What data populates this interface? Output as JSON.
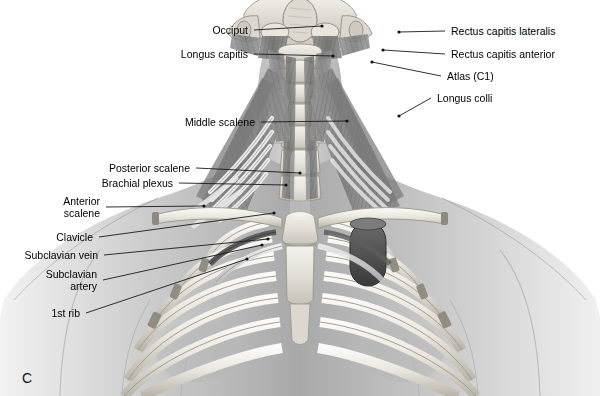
{
  "figure": {
    "panel_letter": "C",
    "view": "anterior",
    "style": "grayscale medical illustration",
    "background_color": "#ffffff",
    "label_color": "#000000",
    "leader_color": "#1a1a1a"
  },
  "labels": [
    {
      "id": "occiput",
      "text": "Occiput",
      "side": "left",
      "x": 248,
      "y": 33,
      "anchor_x": 322,
      "anchor_y": 26
    },
    {
      "id": "longus-capitis",
      "text": "Longus capitis",
      "side": "left",
      "x": 248,
      "y": 57,
      "anchor_x": 333,
      "anchor_y": 56
    },
    {
      "id": "middle-scalene",
      "text": "Middle scalene",
      "side": "left",
      "x": 255,
      "y": 125,
      "anchor_x": 347,
      "anchor_y": 121
    },
    {
      "id": "posterior-scalene",
      "text": "Posterior scalene",
      "side": "left",
      "x": 190,
      "y": 171,
      "anchor_x": 300,
      "anchor_y": 173
    },
    {
      "id": "brachial-plexus",
      "text": "Brachial plexus",
      "side": "left",
      "x": 173,
      "y": 186,
      "anchor_x": 286,
      "anchor_y": 185
    },
    {
      "id": "anterior-scalene",
      "text": "Anterior\nscalene",
      "side": "left",
      "x": 100,
      "y": 204,
      "anchor_x": 204,
      "anchor_y": 206
    },
    {
      "id": "clavicle",
      "text": "Clavicle",
      "side": "left",
      "x": 93,
      "y": 240,
      "anchor_x": 274,
      "anchor_y": 213
    },
    {
      "id": "subclavian-vein",
      "text": "Subclavian vein",
      "side": "left",
      "x": 98,
      "y": 258,
      "anchor_x": 268,
      "anchor_y": 239
    },
    {
      "id": "subclavian-artery",
      "text": "Subclavian\nartery",
      "side": "left",
      "x": 97,
      "y": 277,
      "anchor_x": 262,
      "anchor_y": 245
    },
    {
      "id": "first-rib",
      "text": "1st rib",
      "side": "left",
      "x": 80,
      "y": 316,
      "anchor_x": 247,
      "anchor_y": 259
    },
    {
      "id": "rectus-capitis-lateralis",
      "text": "Rectus capitis lateralis",
      "side": "right",
      "x": 451,
      "y": 34,
      "anchor_x": 399,
      "anchor_y": 32
    },
    {
      "id": "rectus-capitis-anterior",
      "text": "Rectus capitis anterior",
      "side": "right",
      "x": 451,
      "y": 57,
      "anchor_x": 383,
      "anchor_y": 50
    },
    {
      "id": "atlas-c1",
      "text": "Atlas (C1)",
      "side": "right",
      "x": 447,
      "y": 79,
      "anchor_x": 372,
      "anchor_y": 62
    },
    {
      "id": "longus-colli",
      "text": "Longus colli",
      "side": "right",
      "x": 437,
      "y": 101,
      "anchor_x": 399,
      "anchor_y": 116
    }
  ],
  "anatomy_parts": [
    "skull base",
    "occipital bone",
    "atlas (C1) vertebra",
    "cervical vertebral bodies",
    "longus capitis muscle",
    "longus colli muscle",
    "rectus capitis lateralis muscle",
    "rectus capitis anterior muscle",
    "anterior scalene muscle",
    "middle scalene muscle",
    "posterior scalene muscle",
    "brachial plexus",
    "subclavian artery",
    "subclavian vein",
    "clavicle",
    "first rib",
    "rib cage",
    "sternum",
    "head and neck silhouette",
    "shoulders and upper torso silhouette"
  ]
}
